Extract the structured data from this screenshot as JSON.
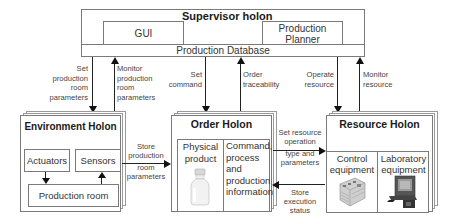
{
  "supervisor": {
    "title": "Supervisor holon",
    "gui_label": "GUI",
    "planner_label_line1": "Production",
    "planner_label_line2": "Planner",
    "database_label": "Production Database"
  },
  "arrows": {
    "set_production_room_parameters": [
      "Set",
      "production",
      "room",
      "parameters"
    ],
    "monitor_production_room_parameters": [
      "Monitor",
      "production",
      "room",
      "parameters"
    ],
    "set_command": [
      "Set",
      "command"
    ],
    "order_traceability": [
      "Order",
      "traceability"
    ],
    "operate_resource": [
      "Operate",
      "resource"
    ],
    "monitor_resource": [
      "Monitor",
      "resource"
    ],
    "store_production_room_parameters": [
      "Store",
      "production",
      "room",
      "parameters"
    ],
    "set_resource_operation": [
      "Set resource",
      "operation",
      "type and",
      "parameters"
    ],
    "store_execution_status": [
      "Store",
      "execution",
      "status"
    ]
  },
  "environment": {
    "title": "Environment Holon",
    "actuators": "Actuators",
    "sensors": "Sensors",
    "production_room": "Production room"
  },
  "order": {
    "title": "Order Holon",
    "physical_product": [
      "Physical",
      "product"
    ],
    "info": [
      "Command,",
      "process",
      "and",
      "production",
      "information"
    ]
  },
  "resource": {
    "title": "Resource Holon",
    "control_equipment": [
      "Control",
      "equipment"
    ],
    "laboratory_equipment": [
      "Laboratory",
      "equipment"
    ]
  }
}
